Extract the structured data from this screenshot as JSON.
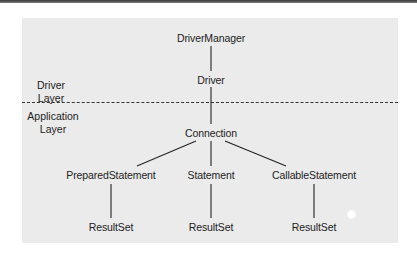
{
  "diagram": {
    "layers": {
      "driver": {
        "line1": "Driver",
        "line2": "Layer"
      },
      "application": {
        "line1": "Application",
        "line2": "Layer"
      }
    },
    "nodes": {
      "driver_manager": "DriverManager",
      "driver": "Driver",
      "connection": "Connection",
      "prepared_statement": "PreparedStatement",
      "statement": "Statement",
      "callable_statement": "CallableStatement",
      "resultset_prepared": "ResultSet",
      "resultset_statement": "ResultSet",
      "resultset_callable": "ResultSet"
    },
    "edges": [
      [
        "DriverManager",
        "Driver"
      ],
      [
        "Driver",
        "Connection"
      ],
      [
        "Connection",
        "PreparedStatement"
      ],
      [
        "Connection",
        "Statement"
      ],
      [
        "Connection",
        "CallableStatement"
      ],
      [
        "PreparedStatement",
        "ResultSet"
      ],
      [
        "Statement",
        "ResultSet"
      ],
      [
        "CallableStatement",
        "ResultSet"
      ]
    ],
    "colors": {
      "panel": "#ebebeb",
      "line": "#222222",
      "text": "#222222"
    }
  }
}
